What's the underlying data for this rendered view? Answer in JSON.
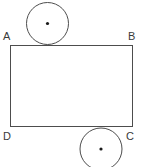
{
  "figure": {
    "kind": "geometry-diagram",
    "canvas": {
      "width": 143,
      "height": 167,
      "background": "#ffffff"
    },
    "stroke_color": "#4d4d4d",
    "dot_color": "#1a1a1a",
    "label_color": "#3a3a3a",
    "rectangle": {
      "name": "ABCD",
      "x": 10,
      "y": 45,
      "width": 123,
      "height": 82,
      "corners": {
        "A": {
          "x": 10,
          "y": 45
        },
        "B": {
          "x": 133,
          "y": 45
        },
        "C": {
          "x": 133,
          "y": 127
        },
        "D": {
          "x": 10,
          "y": 127
        }
      }
    },
    "labels": {
      "a": "A",
      "b": "B",
      "c": "C",
      "d": "D"
    },
    "circles": [
      {
        "id": "top-circle",
        "cx": 47.5,
        "cy": 23.5,
        "r": 21,
        "tangent_to": "AB",
        "position": "above-top-edge",
        "has_center_dot": true
      },
      {
        "id": "bottom-circle",
        "cx": 101,
        "cy": 149,
        "r": 21,
        "tangent_to": "DC",
        "position": "below-bottom-edge",
        "has_center_dot": true
      }
    ]
  }
}
